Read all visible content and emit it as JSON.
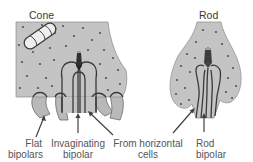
{
  "figure": {
    "type": "anatomical-diagram",
    "colors": {
      "cytoplasm": "#c4c4c4",
      "outline": "#3a3a3a",
      "label_text": "#555555",
      "background": "#ffffff"
    }
  },
  "panels": {
    "cone": {
      "title": "Cone",
      "parts": [
        "mitochondrion",
        "synaptic ribbon",
        "synaptic vesicles",
        "invaginating processes"
      ]
    },
    "rod": {
      "title": "Rod",
      "parts": [
        "synaptic ribbon",
        "synaptic vesicles",
        "invaginating processes"
      ]
    }
  },
  "labels": {
    "flat_bipolars_line1": "Flat",
    "flat_bipolars_line2": "bipolars",
    "invaginating_bipolar_line1": "Invaginating",
    "invaginating_bipolar_line2": "bipolar",
    "horizontal_cells_line1": "From horizontal",
    "horizontal_cells_line2": "cells",
    "rod_bipolar_line1": "Rod",
    "rod_bipolar_line2": "bipolar"
  }
}
